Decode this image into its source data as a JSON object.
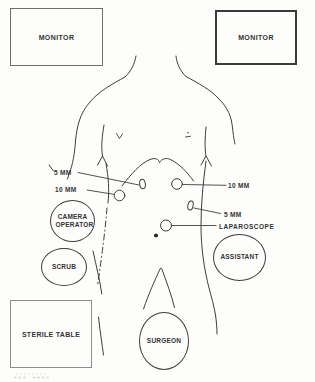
{
  "figure": {
    "monitor_left": {
      "label": "MONITOR"
    },
    "monitor_right": {
      "label": "MONITOR"
    },
    "sterile_table": {
      "label": "STERILE TABLE"
    },
    "staff": {
      "camera_operator": {
        "label": "CAMERA OPERATOR"
      },
      "scrub": {
        "label": "SCRUB"
      },
      "assistant": {
        "label": "ASSISTANT"
      },
      "surgeon": {
        "label": "SURGEON"
      }
    },
    "port_labels": {
      "left_upper_5mm": {
        "label": "5 MM"
      },
      "left_lower_10mm": {
        "label": "10 MM"
      },
      "right_upper_10mm": {
        "label": "10 MM"
      },
      "right_lower_5mm": {
        "label": "5 MM"
      },
      "umbilical_laparoscope": {
        "label": "LAPAROSCOPE"
      }
    },
    "colors": {
      "ink": "#3d3d3d",
      "paper": "#fdfdfc"
    }
  }
}
